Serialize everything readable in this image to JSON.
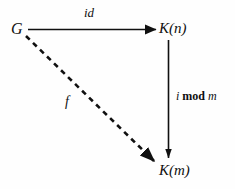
{
  "diagram": {
    "type": "commutative-diagram",
    "background_color": "#fefefe",
    "ink_color": "#101010",
    "nodes": [
      {
        "id": "G",
        "label": "G",
        "x": 18,
        "y": 29
      },
      {
        "id": "K(n)",
        "label": "K(n)",
        "x": 170,
        "y": 29
      },
      {
        "id": "K(m)",
        "label": "K(m)",
        "x": 170,
        "y": 171
      }
    ],
    "edges": [
      {
        "id": "id-arrow",
        "from": "G",
        "to": "K(n)",
        "label": "id",
        "style": "solid",
        "direction": "horizontal-right"
      },
      {
        "id": "i-mod-m-arrow",
        "from": "K(n)",
        "to": "K(m)",
        "label": "i mod m",
        "label_parts": {
          "i": "i",
          "mod": "mod",
          "m": "m"
        },
        "style": "solid",
        "direction": "vertical-down"
      },
      {
        "id": "f-arrow",
        "from": "G",
        "to": "K(m)",
        "label": "f",
        "style": "dashed",
        "direction": "diagonal-down-right"
      }
    ]
  }
}
